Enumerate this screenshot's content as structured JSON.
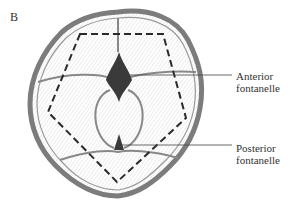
{
  "figure": {
    "panel_letter": "B",
    "labels": [
      {
        "id": "anterior",
        "line1": "Anterior",
        "line2": "fontanelle"
      },
      {
        "id": "posterior",
        "line1": "Posterior",
        "line2": "fontanelle"
      }
    ],
    "colors": {
      "outline": "#6e6e6e",
      "hatching": "#9a9a9a",
      "fontanelle_fill": "#3a3a3a",
      "dashed": "#2a2a2a",
      "leader": "#444444"
    }
  }
}
